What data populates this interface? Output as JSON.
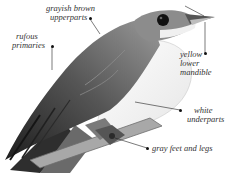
{
  "figure": {
    "colors": {
      "background": "#ffffff",
      "upperparts": "#6f6f6f",
      "underparts": "#f4f4f4",
      "primaries": "#3a3a3a",
      "eye": "#111111",
      "branch": "#9a9a9a",
      "label_text": "#333333",
      "leader_line": "#222222"
    },
    "labels": [
      {
        "id": "upperparts",
        "lines": [
          "grayish brown",
          "upperparts"
        ]
      },
      {
        "id": "primaries",
        "lines": [
          "rufous",
          "primaries"
        ]
      },
      {
        "id": "mandible",
        "lines": [
          "yellow",
          "lower",
          "mandible"
        ]
      },
      {
        "id": "underparts",
        "lines": [
          "white",
          "underparts"
        ]
      },
      {
        "id": "feet",
        "lines": [
          "gray feet and legs"
        ]
      }
    ]
  }
}
